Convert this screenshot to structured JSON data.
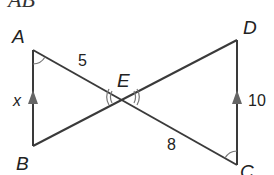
{
  "title": "AB",
  "points": {
    "A": {
      "label": "A",
      "x": 33,
      "y": 50
    },
    "B": {
      "label": "B",
      "x": 33,
      "y": 146
    },
    "C": {
      "label": "C",
      "x": 237,
      "y": 165
    },
    "D": {
      "label": "D",
      "x": 237,
      "y": 40
    },
    "E": {
      "label": "E",
      "x": 123,
      "y": 97
    }
  },
  "segment_labels": {
    "AE": "5",
    "AB": "x",
    "DC": "10",
    "EC": "8"
  },
  "colors": {
    "line": "#3a3a3a",
    "arrow": "#666666",
    "arc": "#777777",
    "text": "#222222"
  }
}
